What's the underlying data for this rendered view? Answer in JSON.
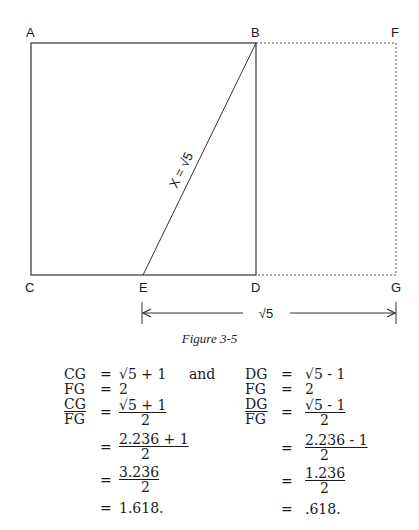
{
  "figure": {
    "caption": "Figure 3-5",
    "points": {
      "A": {
        "label": "A",
        "x": 31,
        "y": 43
      },
      "B": {
        "label": "B",
        "x": 256,
        "y": 43
      },
      "C": {
        "label": "C",
        "x": 31,
        "y": 275
      },
      "D": {
        "label": "D",
        "x": 256,
        "y": 275
      },
      "E": {
        "label": "E",
        "x": 143,
        "y": 275
      },
      "F": {
        "label": "F",
        "x": 396,
        "y": 43
      },
      "G": {
        "label": "G",
        "x": 396,
        "y": 275
      }
    },
    "diagonal_label": "X = √5",
    "dimension_label": "√5",
    "line_color": "#333333"
  },
  "equations": {
    "left": {
      "r1": {
        "lhs": "CG",
        "eq": "=",
        "rhs": "√5 + 1"
      },
      "conj": "and",
      "r2": {
        "lhs": "FG",
        "eq": "=",
        "rhs": "2"
      },
      "r3": {
        "lhs_num": "CG",
        "lhs_den": "FG",
        "eq": "=",
        "num": "√5 + 1",
        "den": "2"
      },
      "r4": {
        "eq": "=",
        "num": "2.236 + 1",
        "den": "2"
      },
      "r5": {
        "eq": "=",
        "num": "3.236",
        "den": "2"
      },
      "r6": {
        "eq": "=",
        "rhs": "1.618."
      }
    },
    "right": {
      "r1": {
        "lhs": "DG",
        "eq": "=",
        "rhs": "√5 - 1"
      },
      "r2": {
        "lhs": "FG",
        "eq": "=",
        "rhs": "2"
      },
      "r3": {
        "lhs_num": "DG",
        "lhs_den": "FG",
        "eq": "=",
        "num": "√5 - 1",
        "den": "2"
      },
      "r4": {
        "eq": "=",
        "num": "2.236 - 1",
        "den": "2"
      },
      "r5": {
        "eq": "=",
        "num": "1.236",
        "den": "2"
      },
      "r6": {
        "eq": "=",
        "rhs": ".618."
      }
    }
  }
}
